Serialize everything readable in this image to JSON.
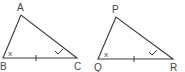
{
  "figure": {
    "triangles": [
      {
        "name": "ABC",
        "vertices": {
          "top": {
            "label": "A",
            "x": 21,
            "y": 15,
            "lx": 17,
            "ly": 11
          },
          "left": {
            "label": "B",
            "x": 3,
            "y": 58,
            "lx": 0,
            "ly": 70
          },
          "right": {
            "label": "C",
            "x": 77,
            "y": 58,
            "lx": 74,
            "ly": 70
          }
        },
        "angle_mark_left": "x",
        "angle_mark_right": "check",
        "side_tick": "BC"
      },
      {
        "name": "PQR",
        "vertices": {
          "top": {
            "label": "P",
            "x": 116,
            "y": 17,
            "lx": 112,
            "ly": 13
          },
          "left": {
            "label": "Q",
            "x": 98,
            "y": 59,
            "lx": 94,
            "ly": 71
          },
          "right": {
            "label": "R",
            "x": 173,
            "y": 59,
            "lx": 170,
            "ly": 71
          }
        },
        "angle_mark_left": "x",
        "angle_mark_right": "check",
        "side_tick": "QR"
      }
    ],
    "labels": {
      "A": "A",
      "B": "B",
      "C": "C",
      "P": "P",
      "Q": "Q",
      "R": "R",
      "angle_x": "x"
    }
  }
}
